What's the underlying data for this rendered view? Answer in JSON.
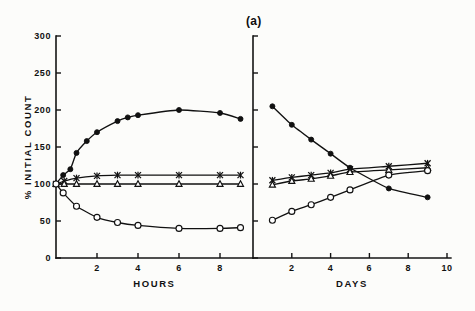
{
  "figure": {
    "panel_label": "(a)",
    "background_color": "#fcfcfa",
    "ink_color": "#111111"
  },
  "chart_data": [
    {
      "type": "line",
      "title": "",
      "subtitle": "",
      "panel": "left",
      "xlabel": "HOURS",
      "ylabel": "% INITIAL COUNT",
      "xlim": [
        0,
        9.6
      ],
      "ylim": [
        0,
        300
      ],
      "xticks": [
        2,
        4,
        6,
        8
      ],
      "xtick_labels": [
        "2",
        "4",
        "6",
        "8"
      ],
      "yticks": [
        0,
        50,
        100,
        150,
        200,
        250,
        300
      ],
      "ytick_labels": [
        "0",
        "50",
        "100",
        "150",
        "200",
        "250",
        "300"
      ],
      "grid": false,
      "legend": "none",
      "series": [
        {
          "name": "filled-circle",
          "marker": "filled-circle",
          "x": [
            0,
            0.35,
            0.7,
            1.0,
            1.5,
            2.0,
            3.0,
            3.5,
            4.0,
            6.0,
            8.0,
            9.0
          ],
          "values": [
            100,
            112,
            120,
            142,
            158,
            170,
            185,
            190,
            193,
            200,
            196,
            188
          ]
        },
        {
          "name": "cross",
          "marker": "cross",
          "x": [
            0,
            0.4,
            1.0,
            2.0,
            3.0,
            4.0,
            6.0,
            8.0,
            9.0
          ],
          "values": [
            100,
            104,
            108,
            111,
            112,
            112,
            112,
            112,
            112
          ]
        },
        {
          "name": "open-triangle",
          "marker": "open-triangle",
          "x": [
            0,
            0.4,
            1.0,
            2.0,
            3.0,
            4.0,
            6.0,
            8.0,
            9.0
          ],
          "values": [
            100,
            100,
            100,
            100,
            100,
            100,
            100,
            100,
            100
          ]
        },
        {
          "name": "open-circle",
          "marker": "open-circle",
          "x": [
            0,
            0.35,
            1.0,
            2.0,
            3.0,
            4.0,
            6.0,
            8.0,
            9.0
          ],
          "values": [
            100,
            88,
            70,
            55,
            48,
            44,
            40,
            40,
            41
          ]
        }
      ]
    },
    {
      "type": "line",
      "title": "",
      "subtitle": "",
      "panel": "right",
      "xlabel": "DAYS",
      "ylabel": "% INITIAL COUNT",
      "xlim": [
        0,
        10.2
      ],
      "ylim": [
        0,
        300
      ],
      "xticks": [
        2,
        4,
        6,
        8,
        10
      ],
      "xtick_labels": [
        "2",
        "4",
        "6",
        "8",
        "10"
      ],
      "yticks": [
        0,
        50,
        100,
        150,
        200,
        250,
        300
      ],
      "ytick_labels": [
        "",
        "",
        "",
        "",
        "",
        "",
        ""
      ],
      "grid": false,
      "legend": "none",
      "series": [
        {
          "name": "filled-circle",
          "marker": "filled-circle",
          "x": [
            1,
            2,
            3,
            4,
            5,
            7,
            9
          ],
          "values": [
            205,
            180,
            160,
            141,
            122,
            94,
            82
          ]
        },
        {
          "name": "cross",
          "marker": "cross",
          "x": [
            1,
            2,
            3,
            4,
            5,
            7,
            9
          ],
          "values": [
            105,
            109,
            112,
            115,
            120,
            124,
            128
          ]
        },
        {
          "name": "open-triangle",
          "marker": "open-triangle",
          "x": [
            1,
            2,
            3,
            4,
            5,
            7,
            9
          ],
          "values": [
            99,
            104,
            107,
            111,
            116,
            119,
            122
          ]
        },
        {
          "name": "open-circle",
          "marker": "open-circle",
          "x": [
            1,
            2,
            3,
            4,
            5,
            7,
            9
          ],
          "values": [
            51,
            63,
            72,
            82,
            92,
            112,
            118
          ]
        }
      ]
    }
  ]
}
